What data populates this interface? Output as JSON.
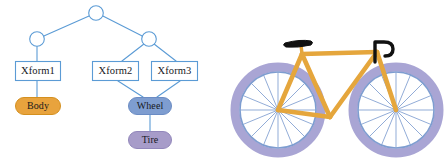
{
  "figure": {
    "background": "#ffffff",
    "width": 445,
    "height": 162,
    "panels": [
      {
        "id": "scene-graph",
        "title": "scene graph"
      },
      {
        "id": "bicycle",
        "title": "bicycle"
      }
    ]
  },
  "scene_graph": {
    "colors": {
      "edge": "#5b9bd5",
      "circle_stroke": "#5b9bd5",
      "circle_fill": "#ffffff",
      "box_stroke": "#5b9bd5",
      "box_fill": "#ffffff",
      "box_text": "#16181c",
      "body_fill": "#e8a33d",
      "body_stroke": "#d4901f",
      "wheel_fill": "#7e9dd0",
      "wheel_stroke": "#6b8cc4",
      "tire_fill": "#a79cc9",
      "tire_stroke": "#9287bb",
      "leaf_text": "#16181c"
    },
    "nodes": {
      "root": {
        "name": "root-group-node",
        "shape": "circle",
        "cx": 96,
        "cy": 13,
        "r": 7.5
      },
      "group_left": {
        "name": "left-group-node",
        "shape": "circle",
        "cx": 37,
        "cy": 39,
        "r": 7.5
      },
      "group_right": {
        "name": "right-group-node",
        "shape": "circle",
        "cx": 149,
        "cy": 39,
        "r": 7.5
      }
    },
    "transform_boxes": [
      {
        "id": "xform1",
        "label": "Xform1",
        "x": 15,
        "y": 61,
        "w": 46,
        "h": 20
      },
      {
        "id": "xform2",
        "label": "Xform2",
        "x": 92,
        "y": 61,
        "w": 47,
        "h": 20
      },
      {
        "id": "xform3",
        "label": "Xform3",
        "x": 151,
        "y": 61,
        "w": 47,
        "h": 20
      }
    ],
    "leaf_boxes": [
      {
        "id": "body",
        "label": "Body",
        "x": 15,
        "y": 97,
        "w": 46,
        "h": 18,
        "kind": "body"
      },
      {
        "id": "wheel",
        "label": "Wheel",
        "x": 128,
        "y": 97,
        "w": 44,
        "h": 18,
        "kind": "wheel"
      },
      {
        "id": "tire",
        "label": "Tire",
        "x": 128,
        "y": 131,
        "w": 44,
        "h": 18,
        "kind": "tire"
      }
    ],
    "edges": [
      {
        "from": "root",
        "to": "group_left"
      },
      {
        "from": "root",
        "to": "group_right"
      },
      {
        "from": "group_left",
        "to": "xform1"
      },
      {
        "from": "group_right",
        "to": "xform2"
      },
      {
        "from": "group_right",
        "to": "xform3"
      },
      {
        "from": "xform1",
        "to": "body"
      },
      {
        "from": "xform2",
        "to": "wheel"
      },
      {
        "from": "xform3",
        "to": "wheel"
      },
      {
        "from": "wheel",
        "to": "tire"
      }
    ]
  },
  "bicycle": {
    "colors": {
      "frame": "#e5a63c",
      "rim_outer": "#a9a5d4",
      "rim_inner": "#ffffff",
      "rim_ring": "#7e9dd0",
      "spoke": "#7e9dd0",
      "hub": "#6b8cc4",
      "saddle": "#111111",
      "handlebar": "#111111"
    },
    "parts": [
      {
        "id": "rear-wheel",
        "label": "rear wheel",
        "cx": 58,
        "cy": 108,
        "r_outer": 48,
        "r_rim": 41,
        "spokes": 16
      },
      {
        "id": "front-wheel",
        "label": "front wheel",
        "cx": 175,
        "cy": 108,
        "r_outer": 48,
        "r_rim": 41,
        "spokes": 16
      },
      {
        "id": "frame",
        "label": "frame"
      },
      {
        "id": "saddle",
        "label": "saddle"
      },
      {
        "id": "handlebar",
        "label": "handlebar"
      }
    ]
  }
}
